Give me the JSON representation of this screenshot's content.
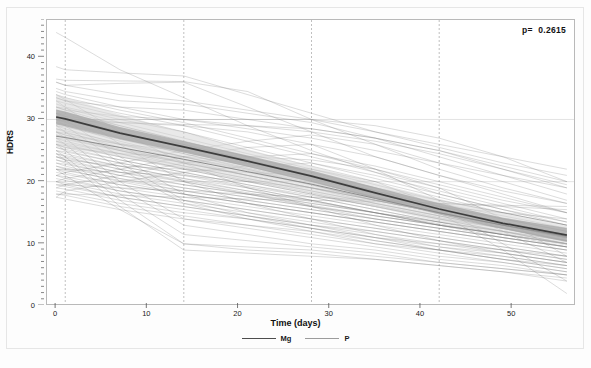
{
  "chart_data": {
    "type": "line",
    "title": "",
    "xlabel": "Time (days)",
    "ylabel": "HDRS",
    "xlim": [
      -1,
      57
    ],
    "ylim": [
      0,
      46
    ],
    "xticks": [
      0,
      10,
      20,
      30,
      40,
      50
    ],
    "yticks": [
      0,
      10,
      20,
      30,
      40
    ],
    "xtick_labels": [
      "0",
      "10",
      "20",
      "30",
      "40",
      "50"
    ],
    "ytick_labels": [
      "0",
      "10",
      "20",
      "30",
      "40"
    ],
    "grid": "vertical dashed gridlines at visit days; faint horizontal gridlines at y=20 and y=30",
    "vertical_gridlines": [
      1,
      14,
      28,
      42
    ],
    "horizontal_gridlines": [
      20,
      30
    ],
    "annotation": "p=  0.2615",
    "legend_position": "bottom-center",
    "legend": [
      {
        "name": "Mg",
        "color": "#4d4d4d"
      },
      {
        "name": "P",
        "color": "#9c9c9c"
      }
    ],
    "series": [
      {
        "name": "Mg",
        "role": "group-mean",
        "color": "#3d3d3d",
        "band_color": "#a8a8a8",
        "x": [
          0,
          1,
          7,
          14,
          21,
          28,
          35,
          42,
          49,
          56
        ],
        "values": [
          30.4,
          30.1,
          27.8,
          25.6,
          23.3,
          20.9,
          18.2,
          15.6,
          13.3,
          11.4
        ],
        "ci_lower": [
          29.2,
          28.9,
          26.8,
          24.7,
          22.4,
          20.0,
          17.3,
          14.7,
          12.4,
          10.3
        ],
        "ci_upper": [
          31.6,
          31.3,
          28.8,
          26.5,
          24.2,
          21.8,
          19.1,
          16.5,
          14.2,
          12.5
        ]
      },
      {
        "name": "P",
        "role": "group-mean",
        "color": "#8c8c8c",
        "band_color": "#d4d4d4",
        "x": [
          0,
          1,
          7,
          14,
          21,
          28,
          35,
          42,
          49,
          56
        ],
        "values": [
          27.3,
          27.1,
          25.5,
          23.6,
          21.6,
          19.6,
          17.3,
          15.0,
          13.0,
          11.2
        ],
        "ci_lower": [
          25.6,
          25.4,
          24.0,
          22.2,
          20.2,
          18.2,
          15.9,
          13.6,
          11.5,
          9.7
        ],
        "ci_upper": [
          34.0,
          33.6,
          30.8,
          27.9,
          25.2,
          22.5,
          19.8,
          17.2,
          14.9,
          12.9
        ]
      }
    ],
    "subject_trajectories_note": "Individual subject spaghetti lines, n≈90, HDRS declining from baseline 17-44 to 1-19 by day 56",
    "subject_trajectories": [
      [
        44.0,
        43.2,
        38.0,
        33.5,
        29.0,
        25.0,
        21.5,
        18.0,
        15.5,
        13.0
      ],
      [
        38.5,
        38.0,
        37.5,
        37.0,
        34.0,
        31.0,
        28.0,
        25.5,
        23.0,
        21.0
      ],
      [
        36.5,
        36.3,
        36.2,
        36.1,
        34.5,
        30.0,
        26.0,
        22.0,
        19.0,
        16.5
      ],
      [
        36.0,
        35.5,
        34.0,
        33.0,
        31.5,
        30.0,
        28.0,
        26.0,
        24.0,
        22.0
      ],
      [
        34.5,
        34.0,
        32.0,
        30.0,
        28.5,
        27.0,
        25.0,
        23.0,
        21.0,
        19.0
      ],
      [
        34.0,
        33.5,
        31.5,
        29.5,
        27.0,
        24.5,
        22.0,
        19.5,
        17.0,
        15.0
      ],
      [
        33.5,
        33.0,
        31.0,
        29.0,
        26.5,
        24.0,
        21.5,
        19.0,
        16.5,
        14.0
      ],
      [
        33.0,
        32.6,
        30.5,
        28.0,
        25.5,
        23.0,
        20.5,
        18.0,
        15.5,
        13.5
      ],
      [
        32.5,
        32.0,
        30.0,
        28.0,
        25.0,
        22.5,
        20.0,
        17.5,
        15.0,
        13.0
      ],
      [
        32.0,
        31.8,
        29.5,
        27.0,
        24.5,
        22.0,
        19.5,
        17.0,
        15.0,
        13.0
      ],
      [
        32.0,
        31.5,
        29.0,
        26.5,
        24.0,
        21.5,
        19.0,
        16.5,
        14.0,
        12.0
      ],
      [
        31.5,
        31.0,
        29.0,
        26.5,
        24.0,
        21.5,
        19.0,
        17.0,
        15.0,
        13.0
      ],
      [
        31.0,
        30.8,
        28.5,
        26.0,
        23.5,
        21.0,
        18.5,
        16.0,
        14.0,
        12.0
      ],
      [
        31.0,
        30.5,
        28.0,
        25.5,
        23.0,
        21.0,
        18.5,
        16.0,
        14.0,
        12.5
      ],
      [
        30.5,
        30.2,
        28.0,
        26.0,
        23.5,
        21.0,
        18.5,
        16.5,
        14.5,
        12.5
      ],
      [
        30.5,
        30.0,
        27.5,
        25.0,
        22.5,
        20.0,
        17.5,
        15.0,
        13.0,
        11.0
      ],
      [
        30.0,
        29.8,
        27.8,
        25.8,
        23.5,
        21.0,
        18.5,
        16.0,
        14.0,
        12.0
      ],
      [
        30.0,
        29.5,
        27.0,
        24.5,
        22.0,
        19.5,
        17.0,
        15.0,
        13.0,
        11.0
      ],
      [
        30.0,
        29.6,
        27.2,
        25.0,
        22.8,
        20.5,
        18.0,
        15.8,
        13.5,
        11.5
      ],
      [
        29.5,
        29.2,
        27.0,
        24.8,
        22.5,
        20.0,
        17.5,
        15.5,
        13.5,
        11.5
      ],
      [
        29.5,
        29.0,
        26.5,
        24.0,
        21.5,
        19.5,
        17.0,
        15.0,
        13.0,
        11.0
      ],
      [
        29.0,
        28.8,
        26.8,
        24.5,
        22.2,
        20.0,
        17.5,
        15.5,
        13.0,
        11.0
      ],
      [
        29.0,
        28.5,
        26.0,
        23.5,
        21.0,
        19.0,
        16.5,
        14.5,
        12.5,
        10.5
      ],
      [
        28.5,
        28.2,
        26.2,
        24.0,
        22.0,
        19.8,
        17.5,
        15.2,
        13.0,
        11.0
      ],
      [
        28.5,
        28.0,
        25.5,
        23.0,
        21.0,
        19.0,
        17.0,
        15.0,
        13.0,
        11.0
      ],
      [
        28.0,
        27.8,
        26.0,
        24.0,
        21.8,
        19.5,
        17.2,
        15.0,
        13.0,
        11.0
      ],
      [
        28.0,
        27.5,
        25.0,
        22.5,
        20.5,
        18.5,
        16.5,
        14.5,
        12.5,
        10.5
      ],
      [
        27.5,
        27.2,
        25.2,
        23.2,
        21.0,
        19.0,
        17.0,
        15.0,
        13.0,
        11.0
      ],
      [
        27.5,
        27.0,
        25.0,
        23.0,
        21.0,
        19.0,
        17.0,
        15.0,
        13.0,
        11.5
      ],
      [
        27.0,
        26.8,
        25.0,
        23.0,
        21.0,
        19.0,
        17.0,
        15.0,
        13.0,
        11.0
      ],
      [
        27.0,
        26.5,
        24.5,
        22.0,
        20.0,
        18.0,
        16.0,
        14.0,
        12.0,
        10.0
      ],
      [
        26.5,
        26.2,
        24.5,
        22.5,
        20.5,
        18.5,
        16.5,
        14.5,
        12.5,
        10.5
      ],
      [
        26.5,
        26.0,
        24.0,
        22.0,
        20.0,
        18.0,
        16.0,
        14.0,
        12.5,
        11.0
      ],
      [
        26.0,
        25.8,
        24.0,
        22.2,
        20.2,
        18.2,
        16.2,
        14.2,
        12.5,
        10.5
      ],
      [
        26.0,
        25.5,
        23.5,
        21.5,
        19.5,
        17.5,
        15.5,
        13.5,
        11.5,
        10.0
      ],
      [
        25.5,
        25.2,
        23.5,
        21.5,
        19.5,
        17.8,
        16.0,
        14.0,
        12.0,
        10.0
      ],
      [
        25.5,
        25.0,
        23.0,
        21.0,
        19.0,
        17.0,
        15.0,
        13.5,
        12.0,
        10.5
      ],
      [
        25.0,
        24.8,
        23.0,
        21.2,
        19.2,
        17.5,
        15.5,
        13.5,
        12.0,
        10.0
      ],
      [
        25.0,
        24.5,
        22.5,
        20.5,
        18.5,
        17.0,
        15.0,
        13.0,
        11.5,
        10.0
      ],
      [
        24.5,
        24.2,
        22.5,
        20.5,
        19.0,
        17.0,
        15.0,
        13.5,
        12.0,
        10.5
      ],
      [
        24.5,
        24.0,
        22.0,
        20.0,
        18.0,
        16.5,
        15.0,
        13.0,
        11.5,
        10.0
      ],
      [
        24.0,
        23.8,
        22.0,
        20.2,
        18.5,
        16.8,
        15.0,
        13.0,
        11.5,
        9.5
      ],
      [
        24.0,
        23.5,
        21.5,
        19.5,
        18.0,
        16.0,
        14.5,
        13.0,
        11.0,
        9.5
      ],
      [
        23.5,
        23.2,
        21.5,
        20.0,
        18.2,
        16.5,
        15.0,
        13.2,
        11.5,
        10.0
      ],
      [
        23.5,
        23.0,
        21.0,
        19.0,
        17.5,
        16.0,
        14.0,
        12.5,
        11.0,
        9.5
      ],
      [
        23.0,
        22.8,
        21.0,
        19.5,
        18.0,
        16.2,
        14.5,
        13.0,
        11.5,
        10.0
      ],
      [
        23.0,
        22.5,
        20.5,
        18.5,
        17.0,
        15.5,
        14.0,
        12.5,
        11.0,
        9.5
      ],
      [
        22.5,
        22.2,
        20.5,
        19.0,
        17.5,
        16.0,
        14.5,
        13.0,
        11.5,
        10.0
      ],
      [
        22.5,
        22.0,
        20.0,
        18.0,
        16.5,
        15.0,
        13.5,
        12.0,
        10.5,
        9.0
      ],
      [
        22.0,
        21.8,
        20.2,
        18.5,
        17.0,
        15.5,
        14.0,
        12.5,
        11.0,
        9.5
      ],
      [
        22.0,
        21.5,
        19.5,
        18.0,
        16.5,
        15.0,
        13.5,
        12.0,
        10.5,
        9.0
      ],
      [
        21.5,
        21.2,
        19.5,
        18.0,
        16.5,
        15.0,
        13.5,
        12.0,
        10.5,
        9.0
      ],
      [
        21.0,
        20.8,
        19.0,
        17.5,
        16.0,
        14.5,
        13.0,
        11.5,
        10.0,
        8.5
      ],
      [
        21.0,
        20.5,
        18.5,
        17.0,
        15.5,
        14.0,
        12.5,
        11.0,
        9.5,
        8.0
      ],
      [
        20.5,
        20.2,
        18.5,
        17.0,
        15.5,
        14.0,
        12.5,
        11.0,
        9.5,
        8.0
      ],
      [
        20.0,
        19.8,
        18.0,
        16.5,
        15.0,
        13.5,
        12.0,
        10.5,
        9.0,
        7.5
      ],
      [
        20.0,
        19.5,
        17.5,
        16.0,
        14.5,
        13.0,
        11.5,
        10.0,
        9.0,
        7.5
      ],
      [
        19.5,
        19.2,
        17.5,
        16.0,
        14.5,
        13.0,
        12.0,
        10.5,
        9.0,
        8.0
      ],
      [
        19.0,
        18.8,
        17.0,
        15.5,
        14.0,
        12.5,
        11.0,
        10.0,
        8.5,
        7.0
      ],
      [
        18.5,
        18.2,
        16.5,
        15.0,
        14.0,
        12.5,
        11.0,
        9.5,
        8.5,
        7.0
      ],
      [
        18.0,
        17.8,
        16.0,
        14.5,
        13.0,
        12.0,
        10.5,
        9.0,
        8.0,
        6.5
      ],
      [
        17.5,
        17.2,
        15.5,
        14.0,
        13.0,
        11.5,
        10.0,
        9.0,
        7.5,
        6.5
      ],
      [
        34.0,
        33.2,
        28.0,
        23.0,
        19.0,
        16.0,
        13.0,
        10.5,
        8.5,
        7.0
      ],
      [
        33.0,
        32.0,
        26.0,
        20.0,
        16.5,
        14.0,
        11.5,
        9.5,
        8.0,
        6.5
      ],
      [
        31.0,
        30.0,
        24.0,
        18.0,
        15.0,
        13.0,
        11.0,
        9.0,
        7.5,
        6.0
      ],
      [
        30.0,
        29.0,
        23.0,
        17.0,
        14.5,
        12.5,
        10.5,
        9.0,
        7.5,
        6.0
      ],
      [
        29.0,
        28.0,
        22.0,
        16.5,
        14.0,
        12.0,
        10.0,
        8.5,
        7.0,
        5.5
      ],
      [
        28.0,
        27.0,
        20.0,
        14.0,
        12.5,
        11.0,
        9.5,
        8.0,
        7.0,
        5.5
      ],
      [
        27.0,
        26.0,
        19.0,
        13.0,
        11.5,
        10.0,
        9.0,
        7.5,
        6.5,
        5.0
      ],
      [
        26.0,
        25.0,
        18.0,
        11.5,
        10.5,
        9.5,
        8.5,
        7.0,
        6.0,
        5.0
      ],
      [
        25.0,
        24.0,
        17.0,
        10.0,
        9.5,
        9.0,
        8.0,
        7.0,
        6.0,
        5.0
      ],
      [
        24.5,
        23.5,
        16.0,
        9.0,
        8.5,
        8.0,
        7.5,
        6.5,
        5.5,
        4.5
      ],
      [
        22.0,
        21.0,
        15.5,
        10.0,
        9.0,
        8.5,
        7.5,
        6.5,
        5.5,
        4.0
      ],
      [
        36.0,
        35.5,
        35.8,
        36.0,
        32.0,
        28.0,
        24.0,
        21.0,
        18.5,
        16.5
      ],
      [
        35.0,
        34.5,
        33.0,
        32.5,
        31.0,
        29.5,
        27.0,
        24.0,
        21.0,
        18.0
      ],
      [
        33.5,
        33.0,
        32.0,
        31.5,
        30.0,
        28.5,
        27.0,
        25.0,
        22.5,
        20.0
      ],
      [
        32.0,
        31.5,
        30.5,
        30.0,
        29.0,
        28.0,
        26.5,
        24.5,
        22.0,
        19.5
      ],
      [
        30.0,
        29.8,
        29.5,
        29.2,
        29.0,
        28.5,
        27.0,
        25.0,
        22.0,
        19.0
      ],
      [
        30.0,
        30.0,
        30.0,
        30.0,
        30.0,
        30.0,
        29.0,
        27.0,
        24.0,
        20.0
      ],
      [
        21.0,
        21.5,
        23.0,
        25.0,
        26.5,
        27.5,
        26.0,
        23.0,
        20.0,
        17.0
      ],
      [
        20.0,
        20.5,
        22.0,
        24.0,
        25.5,
        26.0,
        24.0,
        21.0,
        18.0,
        15.0
      ],
      [
        19.0,
        19.5,
        21.0,
        23.0,
        24.0,
        24.5,
        22.5,
        20.0,
        17.5,
        15.0
      ],
      [
        17.5,
        18.5,
        20.0,
        21.5,
        22.5,
        23.0,
        21.0,
        18.5,
        16.0,
        13.5
      ],
      [
        28.0,
        27.5,
        26.0,
        25.0,
        24.0,
        23.5,
        22.0,
        19.0,
        14.0,
        8.0
      ],
      [
        26.0,
        25.5,
        24.5,
        24.0,
        23.0,
        22.0,
        20.0,
        16.0,
        10.0,
        4.0
      ],
      [
        24.0,
        23.5,
        22.5,
        22.0,
        21.5,
        21.0,
        19.0,
        15.0,
        9.0,
        2.0
      ],
      [
        31.0,
        30.5,
        29.5,
        29.0,
        28.0,
        26.0,
        22.0,
        17.0,
        12.0,
        7.0
      ],
      [
        22.0,
        22.0,
        21.5,
        21.0,
        20.0,
        19.0,
        17.5,
        16.0,
        15.0,
        14.0
      ],
      [
        19.5,
        19.5,
        19.0,
        18.5,
        18.0,
        17.5,
        17.0,
        16.5,
        16.0,
        15.5
      ],
      [
        18.0,
        18.0,
        17.8,
        17.5,
        17.2,
        17.0,
        16.8,
        16.5,
        16.2,
        16.0
      ]
    ]
  }
}
